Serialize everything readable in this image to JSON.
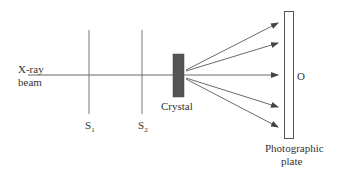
{
  "labels": {
    "beam_line1": "X-ray",
    "beam_line2": "beam",
    "slit1": "S",
    "slit1_sub": "1",
    "slit2": "S",
    "slit2_sub": "2",
    "crystal": "Crystal",
    "origin": "O",
    "plate_line1": "Photographic",
    "plate_line2": "plate"
  },
  "colors": {
    "line": "#555555",
    "crystal_fill": "#555555",
    "background": "#ffffff"
  }
}
